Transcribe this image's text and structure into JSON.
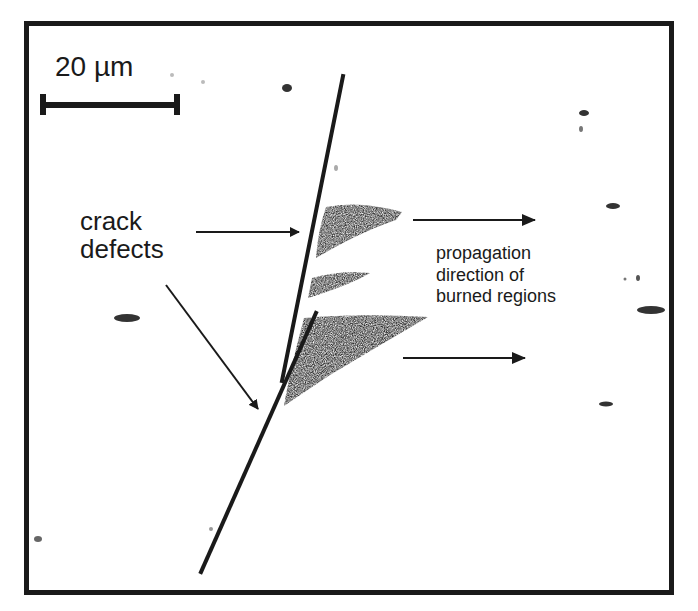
{
  "figure": {
    "scale_bar": {
      "label": "20 µm",
      "length_px": 135
    },
    "annotations": [
      {
        "id": "crack-label",
        "text": "crack\ndefects"
      },
      {
        "id": "propagation-label",
        "text": "propagation\ndirection of\nburned regions"
      }
    ],
    "colors": {
      "ink": "#1a1a1a",
      "background": "#ffffff",
      "burn": "#2a2a2a"
    }
  }
}
